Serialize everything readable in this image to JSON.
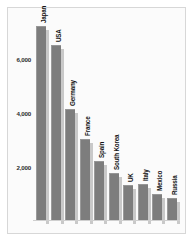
{
  "chart_data": {
    "type": "bar",
    "title": "Automobiles",
    "subtitle": "Production of passenger cars in thousands (top ten countries, 1994)",
    "xlabel": "",
    "ylabel": "",
    "ylim": [
      0,
      7600
    ],
    "grid": false,
    "legend": "none",
    "yticks": [
      2000,
      4000,
      6000
    ],
    "ytick_labels": [
      "2,000",
      "4,000",
      "6,000"
    ],
    "categories": [
      "Japan",
      "USA",
      "Germany",
      "France",
      "Spain",
      "South Korea",
      "UK",
      "Italy",
      "Mexico",
      "Russia"
    ],
    "values": [
      7200,
      6500,
      4100,
      3000,
      2200,
      1750,
      1300,
      1350,
      950,
      800
    ],
    "bar_color": "#7d7d7d",
    "bar_shadow_color": "#c9c9c9",
    "plot_background": "#fbfbfb",
    "text_color": "#151515"
  }
}
